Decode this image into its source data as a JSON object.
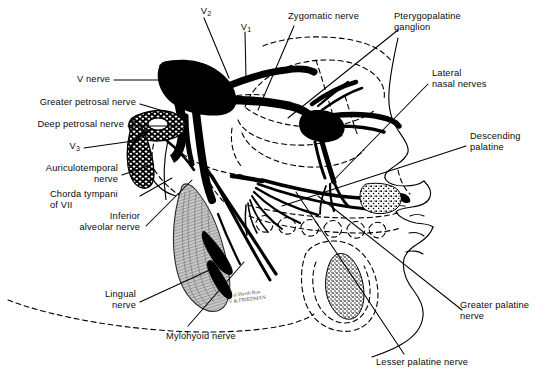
{
  "figure": {
    "background_color": "#ffffff",
    "ink_color": "#000000",
    "muscle_fill": "#b9b9b9",
    "signature": "m sl Havth Ron\nV & FRIEDMAN"
  },
  "labels": {
    "v2": "V",
    "v2_sub": "2",
    "v1": "V",
    "v1_sub": "1",
    "v3": "V",
    "v3_sub": "3",
    "v_nerve": "V nerve",
    "greater_petrosal": "Greater petrosal nerve",
    "deep_petrosal": "Deep petrosal nerve",
    "auriculotemporal": "Auriculotemporal\nnerve",
    "chorda_tympani": "Chorda tympani\nof VII",
    "inferior_alveolar": "Inferior\nalveolar nerve",
    "lingual": "Lingual\nnerve",
    "mylohyoid": "Mylohyoid nerve",
    "zygomatic": "Zygomatic nerve",
    "pterygopalatine_ganglion": "Pterygopalatine\nganglion",
    "lateral_nasal": "Lateral\nnasal nerves",
    "descending_palatine": "Descending\npalatine",
    "greater_palatine": "Greater palatine\nnerve",
    "lesser_palatine": "Lesser palatine nerve"
  }
}
